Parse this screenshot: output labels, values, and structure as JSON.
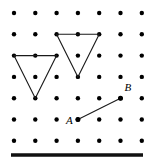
{
  "figure": {
    "kind": "dot-lattice-geometry-figure",
    "width": 154,
    "height": 165,
    "background_color": "#ffffff",
    "ink_color": "#1a1a1a",
    "dot_color": "#000000"
  },
  "chart_data": {
    "type": "scatter",
    "title": "",
    "subtitle": "",
    "xlabel": "",
    "ylabel": "",
    "grid": false,
    "legend_position": "none",
    "xlim": [
      0,
      6
    ],
    "ylim": [
      0,
      6
    ],
    "tick_labels": {
      "x": [],
      "y": []
    },
    "lattice": {
      "columns": 7,
      "rows": 7,
      "origin_px": {
        "x": 14,
        "y": 13
      },
      "spacing_px": 21.3,
      "dot_radius_px": 2.2,
      "column_positions_px": [
        14,
        35.3,
        56.6,
        77.9,
        99.2,
        120.5,
        141.8
      ],
      "row_positions_px": [
        13,
        34.3,
        55.6,
        76.9,
        98.2,
        119.5,
        140.8
      ]
    },
    "shapes": [
      {
        "name": "left-triangle",
        "kind": "triangle",
        "orientation": "downward-pointing",
        "closed": true,
        "vertices_grid": [
          [
            0,
            2
          ],
          [
            2,
            2
          ],
          [
            1,
            4
          ]
        ],
        "vertices_px": [
          [
            14,
            55.6
          ],
          [
            56.6,
            55.6
          ],
          [
            35.3,
            98.2
          ]
        ],
        "base_length_cells": 2,
        "height_cells": 2
      },
      {
        "name": "right-triangle",
        "kind": "triangle",
        "orientation": "downward-pointing",
        "closed": true,
        "vertices_grid": [
          [
            2,
            1
          ],
          [
            4,
            1
          ],
          [
            3,
            3
          ]
        ],
        "vertices_px": [
          [
            56.6,
            34.3
          ],
          [
            99.2,
            34.3
          ],
          [
            77.9,
            76.9
          ]
        ],
        "base_length_cells": 2,
        "height_cells": 2
      }
    ],
    "segments": [
      {
        "name": "segment-AB",
        "from_label": "A",
        "to_label": "B",
        "from_grid": [
          3,
          5
        ],
        "to_grid": [
          5,
          4
        ],
        "from_px": [
          77.9,
          119.5
        ],
        "to_px": [
          120.5,
          98.2
        ],
        "run_cells": 2,
        "rise_cells": 1
      }
    ],
    "points": [
      {
        "label": "A",
        "grid": [
          3,
          5
        ],
        "px": [
          77.9,
          119.5
        ],
        "label_offset_px": [
          -12,
          -5
        ],
        "label_style": "italic"
      },
      {
        "label": "B",
        "grid": [
          5,
          4
        ],
        "px": [
          120.5,
          98.2
        ],
        "label_offset_px": [
          4,
          -16
        ],
        "label_style": "italic"
      }
    ],
    "base_bar": {
      "name": "base-bar",
      "x_start_px": 11,
      "x_end_px": 143,
      "y_px": 155,
      "thickness_px": 3.5,
      "color": "#111111"
    }
  }
}
